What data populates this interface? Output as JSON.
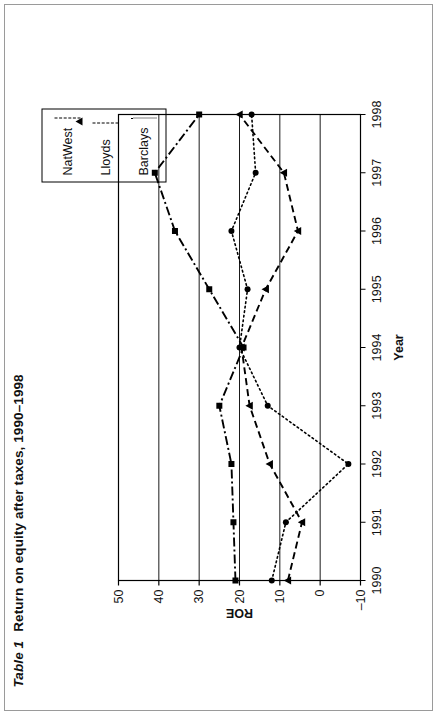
{
  "figure": {
    "table_label": "Table 1",
    "title": "Return on equity after taxes, 1990–1998"
  },
  "legend": {
    "position": "top-right",
    "items": [
      {
        "label": "NatWest",
        "marker": "triangle-marker",
        "dash": "dashed"
      },
      {
        "label": "Lloyds",
        "marker": "square-marker",
        "dash": "dash-dot"
      },
      {
        "label": "Barclays",
        "marker": "circle-marker",
        "dash": "dotted"
      }
    ]
  },
  "axes": {
    "y_label": "ROE",
    "x_label": "Year",
    "y_ticks": [
      "50",
      "40",
      "30",
      "20",
      "10",
      "0",
      "–10"
    ],
    "x_ticks": [
      "1990",
      "1991",
      "1992",
      "1993",
      "1994",
      "1995",
      "1996",
      "1997",
      "1998"
    ]
  },
  "colors": {
    "line": "#000000",
    "axis": "#000000",
    "frame": "#9a9a9a",
    "background": "#ffffff"
  },
  "chart_data": {
    "type": "line",
    "xlabel": "Year",
    "ylabel": "ROE",
    "x": [
      1990,
      1991,
      1992,
      1993,
      1994,
      1995,
      1996,
      1997,
      1998
    ],
    "xlim": [
      1990,
      1998
    ],
    "ylim": [
      -10,
      50
    ],
    "yticks": [
      50,
      40,
      30,
      20,
      10,
      0,
      -10
    ],
    "grid": true,
    "legend": "top-right",
    "series": [
      {
        "name": "NatWest",
        "marker": "triangle",
        "dash": "dashed",
        "values": [
          8,
          4.5,
          12.5,
          17.5,
          19.5,
          13.5,
          5.5,
          9,
          20
        ]
      },
      {
        "name": "Lloyds",
        "marker": "square",
        "dash": "dash-dot",
        "values": [
          21,
          21.5,
          22,
          25,
          19,
          27.5,
          36,
          41,
          30
        ]
      },
      {
        "name": "Barclays",
        "marker": "circle",
        "dash": "dotted",
        "values": [
          12,
          8.5,
          -7,
          13,
          20,
          18,
          22,
          16,
          17
        ]
      }
    ]
  }
}
